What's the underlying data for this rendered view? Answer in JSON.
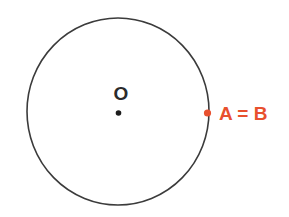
{
  "figure": {
    "background_color": "#ffffff",
    "circle": {
      "stroke_color": "#3b3b3b",
      "center_label": "O",
      "center_label_color": "#2b2b2b",
      "center_dot_color": "#1c1c1c"
    },
    "point_on_circle": {
      "label": "A = B",
      "color": "#e8502e"
    }
  }
}
